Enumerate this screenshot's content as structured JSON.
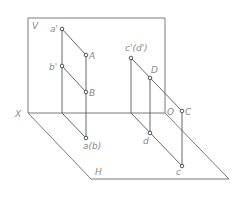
{
  "diagram": {
    "planes": {
      "v_label": "V",
      "h_label": "H",
      "x_axis_label": "X",
      "origin_label": "O"
    },
    "points": {
      "a_prime": "a'",
      "A": "A",
      "b_prime": "b'",
      "B": "B",
      "ab": "a(b)",
      "cd_prime": "c'(d')",
      "D": "D",
      "C": "C",
      "d": "d",
      "c": "c"
    },
    "colors": {
      "line": "#555555",
      "frame": "#7a7a7a",
      "label": "#8a8a8a",
      "background": "#ffffff"
    }
  }
}
